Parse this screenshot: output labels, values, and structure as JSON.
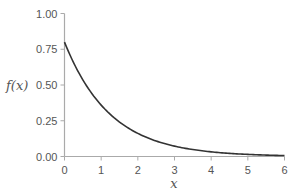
{
  "chart_data": {
    "type": "line",
    "title": "",
    "xlabel": "x",
    "ylabel": "f(x)",
    "xlim": [
      0,
      6
    ],
    "ylim": [
      0,
      1
    ],
    "x_ticks": [
      "0",
      "1",
      "2",
      "3",
      "4",
      "5",
      "6"
    ],
    "y_ticks": [
      "0.00",
      "0.25",
      "0.50",
      "0.75",
      "1.00"
    ],
    "grid": false,
    "legend": null,
    "series": [
      {
        "name": "f(x) = 0.8 e^(-0.8x)",
        "x": [
          0,
          0.5,
          1,
          1.5,
          2,
          2.5,
          3,
          3.5,
          4,
          4.5,
          5,
          5.5,
          6
        ],
        "values": [
          0.8,
          0.54,
          0.36,
          0.24,
          0.16,
          0.11,
          0.07,
          0.05,
          0.03,
          0.02,
          0.01,
          0.01,
          0.01
        ],
        "color": "#333333"
      }
    ]
  }
}
